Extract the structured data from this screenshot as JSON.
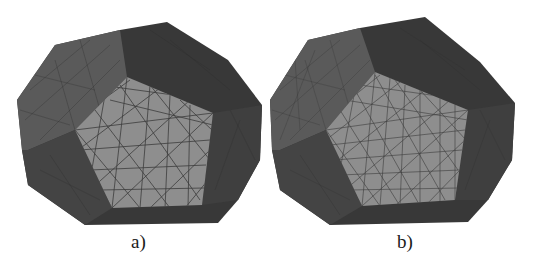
{
  "figure": {
    "colors": {
      "background": "#ffffff",
      "dark_face": "#3a3a3a",
      "mid_face": "#555555",
      "side_face": "#4a4a4a",
      "light_face": "#8f8f8f",
      "mesh_line": "#3c3c3c",
      "caption": "#1a1a1a"
    },
    "panels": [
      {
        "id": "a",
        "label": "a)",
        "description": "coarse triangular surface mesh on polyhedron"
      },
      {
        "id": "b",
        "label": "b)",
        "description": "refined triangular surface mesh on polyhedron"
      }
    ]
  }
}
